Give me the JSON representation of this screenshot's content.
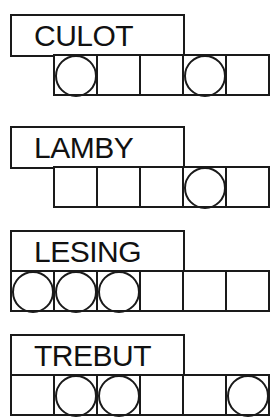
{
  "puzzles": [
    {
      "word": "CULOT",
      "cells": 5,
      "circled": [
        1,
        4
      ]
    },
    {
      "word": "LAMBY",
      "cells": 5,
      "circled": [
        4
      ]
    },
    {
      "word": "LESING",
      "cells": 6,
      "circled": [
        1,
        2,
        3
      ]
    },
    {
      "word": "TREBUT",
      "cells": 6,
      "circled": [
        2,
        3,
        6
      ]
    }
  ],
  "colors": {
    "ink": "#1a1a1a",
    "background": "#ffffff"
  }
}
